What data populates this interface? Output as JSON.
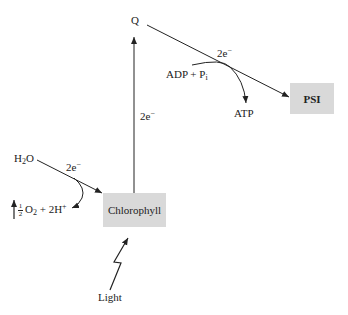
{
  "diagram": {
    "nodes": {
      "q": {
        "label": "Q"
      },
      "psi": {
        "label": "PSI"
      },
      "chlorophyll": {
        "label": "Chlorophyll"
      },
      "h2o": {
        "label_main": "H",
        "label_sub": "2",
        "label_tail": "O"
      },
      "adp": {
        "label_main": "ADP + P",
        "label_sub": "i"
      },
      "atp": {
        "label": "ATP"
      },
      "oxygen": {
        "frac_num": "1",
        "frac_den": "2",
        "label_o": "O",
        "label_o_sub": "2",
        "label_mid": " + 2H",
        "label_sup": "+"
      },
      "light": {
        "label": "Light"
      }
    },
    "edges": {
      "q_to_psi": {
        "label_main": "2e",
        "label_sup": "−"
      },
      "chlorophyll_to_q": {
        "label_main": "2e",
        "label_sup": "−"
      },
      "h2o_to_chlorophyll": {
        "label_main": "2e",
        "label_sup": "−"
      }
    },
    "colors": {
      "box_fill": "#d9d9d9",
      "line": "#222222",
      "background": "#ffffff"
    }
  }
}
